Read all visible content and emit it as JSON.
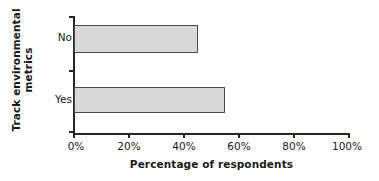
{
  "chart_data": {
    "type": "bar",
    "orientation": "horizontal",
    "title": "",
    "categories": [
      "No",
      "Yes"
    ],
    "values": [
      45,
      55
    ],
    "series": [
      {
        "name": "Percentage of respondents",
        "values": [
          45,
          55
        ]
      }
    ],
    "xlabel": "Percentage of respondents",
    "ylabel": "Track environmental metrics",
    "ylabel_lines": [
      "Track environmental",
      "metrics"
    ],
    "xlim": [
      0,
      100
    ],
    "xticks": [
      0,
      20,
      40,
      60,
      80,
      100
    ],
    "xtick_labels": [
      "0%",
      "20%",
      "40%",
      "60%",
      "80%",
      "100%"
    ],
    "grid": false,
    "legend": false,
    "bar_fill_color": "#d8d8d8",
    "bar_edge_color": "#4a4a4a",
    "axis_color": "#262626",
    "background_color": "#ffffff"
  }
}
